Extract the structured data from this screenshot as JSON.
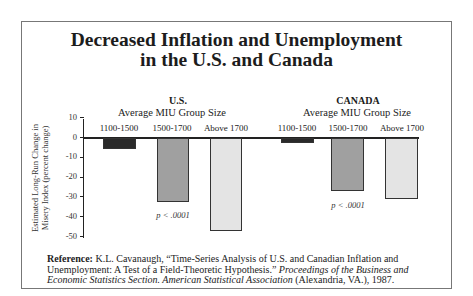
{
  "title": {
    "line1": "Decreased Inflation and Unemployment",
    "line2": "in the U.S. and Canada"
  },
  "axis": {
    "ylabel_line1": "Estimated Long-Run Change in",
    "ylabel_line2": "Misery Index (percent change)",
    "ticks": [
      "10",
      "0",
      "-10",
      "-20",
      "-30",
      "-40",
      "-50"
    ]
  },
  "groups": [
    {
      "name": "U.S.",
      "subtitle": "Average MIU Group Size",
      "categories": [
        "1100-1500",
        "1500-1700",
        "Above 1700"
      ],
      "p_value": "p < .0001"
    },
    {
      "name": "CANADA",
      "subtitle": "Average MIU Group Size",
      "categories": [
        "1100-1500",
        "1500-1700",
        "Above 1700"
      ],
      "p_value": "p < .0001"
    }
  ],
  "reference": {
    "label": "Reference:",
    "text_plain": " K.L. Cavanaugh, “Time-Series Analysis of U.S. and Canadian Inflation and Unemployment: A Test of a Field-Theoretic Hypothesis.” ",
    "text_italic": "Proceedings of the Business and Economic Statistics Section. American Statistical Association",
    "text_end": " (Alexandria, VA.), 1987."
  },
  "colors": {
    "bar_1100_1500": "#2a2a2a",
    "bar_1500_1700": "#a0a0a0",
    "bar_above_1700": "#e4e4e4"
  },
  "chart_data": {
    "type": "bar",
    "title": "Decreased Inflation and Unemployment in the U.S. and Canada",
    "xlabel": "Average MIU Group Size",
    "ylabel": "Estimated Long-Run Change in Misery Index (percent change)",
    "ylim": [
      -50,
      10
    ],
    "yticks": [
      10,
      0,
      -10,
      -20,
      -30,
      -40,
      -50
    ],
    "grid": false,
    "categories": [
      "1100-1500",
      "1500-1700",
      "Above 1700"
    ],
    "series": [
      {
        "name": "U.S.",
        "values": [
          -6,
          -32.5,
          -47
        ]
      },
      {
        "name": "CANADA",
        "values": [
          -3,
          -27,
          -31
        ]
      }
    ],
    "annotations": [
      "p < .0001 (U.S.)",
      "p < .0001 (CANADA)"
    ]
  }
}
